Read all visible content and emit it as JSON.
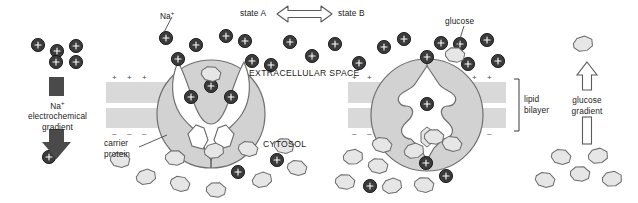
{
  "figure": {
    "type": "cell-biology-diagram",
    "topic": "Na+/glucose symport carrier protein conformational cycle"
  },
  "labels": {
    "na_ion": "Na",
    "na_superscript": "+",
    "na_gradient_line1": "electrochemical",
    "na_gradient_line2": "gradient",
    "state_a": "state A",
    "state_b": "state B",
    "extracellular_space": "EXTRACELLULAR SPACE",
    "cytosol": "CYTOSOL",
    "carrier_protein_line1": "carrier",
    "carrier_protein_line2": "protein",
    "glucose": "glucose",
    "lipid_bilayer_line1": "lipid",
    "lipid_bilayer_line2": "bilayer",
    "glucose_gradient_line1": "glucose",
    "glucose_gradient_line2": "gradient"
  },
  "colors": {
    "background": "#ffffff",
    "ion_fill": "#3b3b3b",
    "ion_stroke": "#1a1a1a",
    "glucose_fill": "#e4e4e4",
    "glucose_stroke": "#5a5a5a",
    "membrane_band": "#d9d9d9",
    "protein_fill": "#d2d2d2",
    "protein_stroke": "#6e6e6e",
    "protein_inner": "#ffffff",
    "text": "#1a1a1a",
    "arrow_outline": "#555555",
    "gradient_bar": "#4a4a4a"
  },
  "membrane": {
    "outer_leaflet_charges": "+",
    "inner_leaflet_charges": "-",
    "segments": [
      {
        "name": "left-membrane",
        "x": 106,
        "width": 140
      },
      {
        "name": "right-membrane",
        "x": 348,
        "width": 158
      }
    ],
    "bands": [
      {
        "name": "outer-leaflet",
        "y": 82,
        "height": 21
      },
      {
        "name": "inner-leaflet",
        "y": 108,
        "height": 20
      }
    ]
  },
  "panels": {
    "left_gradient": {
      "name": "sodium-electrochemical-gradient",
      "direction": "downward",
      "ions_above": 5,
      "ions_below": 1
    },
    "state_a_panel": {
      "name": "carrier-protein-state-a",
      "conformation": "open-to-extracellular-space",
      "bound_sodium_ions": 2,
      "bound_glucose": 0
    },
    "state_b_panel": {
      "name": "carrier-protein-state-b",
      "conformation": "occluded-closed",
      "bound_sodium_ions": 1,
      "bound_glucose": 1
    },
    "right_gradient": {
      "name": "glucose-gradient",
      "direction": "upward",
      "glucose_above": 1,
      "glucose_below": 5
    }
  },
  "particles": {
    "sodium_ions": [
      {
        "x": 38,
        "y": 45
      },
      {
        "x": 57,
        "y": 51
      },
      {
        "x": 76,
        "y": 46
      },
      {
        "x": 56,
        "y": 62
      },
      {
        "x": 76,
        "y": 62
      },
      {
        "x": 49,
        "y": 157
      },
      {
        "x": 166,
        "y": 38
      },
      {
        "x": 196,
        "y": 45
      },
      {
        "x": 226,
        "y": 36
      },
      {
        "x": 245,
        "y": 41
      },
      {
        "x": 178,
        "y": 59
      },
      {
        "x": 212,
        "y": 67
      },
      {
        "x": 252,
        "y": 61
      },
      {
        "x": 271,
        "y": 65
      },
      {
        "x": 290,
        "y": 42
      },
      {
        "x": 312,
        "y": 56
      },
      {
        "x": 335,
        "y": 44
      },
      {
        "x": 359,
        "y": 63
      },
      {
        "x": 384,
        "y": 47
      },
      {
        "x": 404,
        "y": 39
      },
      {
        "x": 427,
        "y": 57
      },
      {
        "x": 441,
        "y": 43
      },
      {
        "x": 460,
        "y": 44
      },
      {
        "x": 468,
        "y": 64
      },
      {
        "x": 487,
        "y": 40
      },
      {
        "x": 498,
        "y": 61
      },
      {
        "x": 165,
        "y": 97
      },
      {
        "x": 212,
        "y": 86
      },
      {
        "x": 231,
        "y": 97
      },
      {
        "x": 400,
        "y": 100
      },
      {
        "x": 355,
        "y": 128
      },
      {
        "x": 238,
        "y": 172
      },
      {
        "x": 277,
        "y": 160
      },
      {
        "x": 426,
        "y": 163
      },
      {
        "x": 446,
        "y": 176
      },
      {
        "x": 370,
        "y": 186
      }
    ],
    "glucose_molecules": [
      {
        "x": 199,
        "y": 79,
        "r": 12
      },
      {
        "x": 219,
        "y": 101,
        "r": -8
      },
      {
        "x": 245,
        "y": 102,
        "r": 14
      },
      {
        "x": 455,
        "y": 55,
        "r": 8
      },
      {
        "x": 407,
        "y": 124,
        "r": -5
      },
      {
        "x": 120,
        "y": 160,
        "r": 10
      },
      {
        "x": 146,
        "y": 177,
        "r": -12
      },
      {
        "x": 175,
        "y": 158,
        "r": 6
      },
      {
        "x": 180,
        "y": 184,
        "r": 16
      },
      {
        "x": 214,
        "y": 151,
        "r": -9
      },
      {
        "x": 248,
        "y": 149,
        "r": 12
      },
      {
        "x": 216,
        "y": 190,
        "r": 5
      },
      {
        "x": 262,
        "y": 180,
        "r": -14
      },
      {
        "x": 284,
        "y": 146,
        "r": 9
      },
      {
        "x": 297,
        "y": 168,
        "r": 12
      },
      {
        "x": 353,
        "y": 157,
        "r": -6
      },
      {
        "x": 378,
        "y": 166,
        "r": 10
      },
      {
        "x": 382,
        "y": 145,
        "r": 14
      },
      {
        "x": 414,
        "y": 151,
        "r": -10
      },
      {
        "x": 345,
        "y": 182,
        "r": 8
      },
      {
        "x": 392,
        "y": 186,
        "r": -12
      },
      {
        "x": 434,
        "y": 137,
        "r": 6
      },
      {
        "x": 452,
        "y": 144,
        "r": 15
      },
      {
        "x": 424,
        "y": 185,
        "r": 9
      },
      {
        "x": 583,
        "y": 44,
        "r": -10
      },
      {
        "x": 561,
        "y": 157,
        "r": 12
      },
      {
        "x": 598,
        "y": 156,
        "r": -8
      },
      {
        "x": 580,
        "y": 174,
        "r": 6
      },
      {
        "x": 545,
        "y": 180,
        "r": 14
      },
      {
        "x": 612,
        "y": 179,
        "r": -5
      }
    ]
  }
}
